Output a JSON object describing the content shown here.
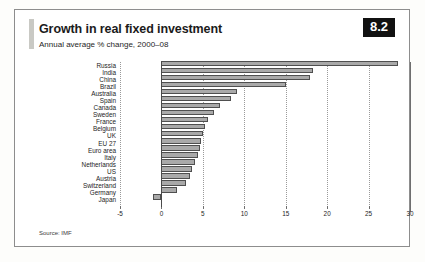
{
  "figure": {
    "badge": "8.2",
    "title": "Growth in real fixed investment",
    "subtitle": "Annual average % change, 2000–08",
    "source": "Source: IMF"
  },
  "chart_data": {
    "type": "bar",
    "orientation": "horizontal",
    "title": "Growth in real fixed investment",
    "subtitle": "Annual average % change, 2000–08",
    "xlabel": "",
    "ylabel": "",
    "xlim": [
      -5,
      30
    ],
    "xticks": [
      -5,
      0,
      5,
      10,
      15,
      20,
      25,
      30
    ],
    "xtick_labels": [
      "-5",
      "0",
      "5",
      "10",
      "15",
      "20",
      "25",
      "30"
    ],
    "grid": true,
    "grid_style": "dotted-vertical",
    "legend": false,
    "bar_color": "#a9a9a9",
    "bar_edge_color": "#4f4f4f",
    "categories": [
      "Russia",
      "India",
      "China",
      "Brazil",
      "Australia",
      "Spain",
      "Canada",
      "Sweden",
      "France",
      "Belgium",
      "UK",
      "EU 27",
      "Euro area",
      "Italy",
      "Netherlands",
      "US",
      "Austria",
      "Switzerland",
      "Germany",
      "Japan"
    ],
    "values": [
      28.6,
      18.3,
      17.9,
      15.0,
      9.1,
      8.4,
      7.1,
      6.3,
      5.6,
      5.2,
      5.0,
      4.8,
      4.6,
      4.4,
      4.1,
      3.7,
      3.4,
      3.0,
      1.9,
      -1.0
    ]
  }
}
